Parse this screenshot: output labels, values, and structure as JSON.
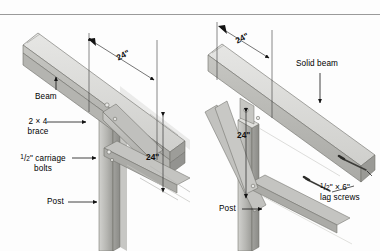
{
  "figure": {
    "background_color": "#fdfdfd",
    "rule_color": "#9a9a9a",
    "wood_light": "#d8d8d6",
    "wood_mid": "#b9b9b6",
    "wood_dark": "#8e8e8b",
    "outline_color": "#55554f",
    "leader_color": "#1a1a1a"
  },
  "left_panel": {
    "name": "built-up-beam-detail",
    "labels": {
      "beam": "Beam",
      "brace_line1": "2 × 4",
      "brace_line2": "brace",
      "bolts_frac_num": "1",
      "bolts_frac_den": "2",
      "bolts_line1_rest": "\" carriage",
      "bolts_line2": "bolts",
      "post": "Post"
    },
    "dimensions": {
      "horizontal": "24\"",
      "vertical": "24\""
    }
  },
  "right_panel": {
    "name": "solid-beam-detail",
    "labels": {
      "solid_beam": "Solid beam",
      "lag_frac_num": "1",
      "lag_frac_den": "2",
      "lag_line1_rest": "\" × 6\"",
      "lag_line2": "lag screws",
      "post": "Post"
    },
    "dimensions": {
      "horizontal": "24\"",
      "vertical": "24\""
    }
  }
}
